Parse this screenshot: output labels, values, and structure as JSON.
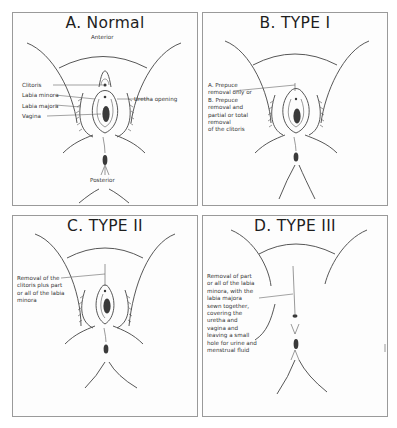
{
  "panels": [
    {
      "id": "A",
      "title": "A. Normal",
      "labels": {
        "anterior": "Anterior",
        "posterior": "Posterior",
        "clitoris": "Clitoris",
        "labia_minora": "Labia minora",
        "labia_majora": "Labia majora",
        "vagina": "Vagina",
        "urethra_opening": "Uretha opening"
      }
    },
    {
      "id": "B",
      "title": "B. TYPE I",
      "description": "A. Prepuce\nremoval only or\nB. Prepuce\nremoval and\npartial or total\nremoval\nof the clitoris"
    },
    {
      "id": "C",
      "title": "C. TYPE II",
      "description": "Removal of the\nclitoris plus part\nor all of the labia\nminora"
    },
    {
      "id": "D",
      "title": "D. TYPE III",
      "description": "Removal of part\nor all of the labia\nminora, with the\nlabia majora\nsewn together,\ncovering the\nuretha and\nvagina and\nleaving a small\nhole for urine and\nmenstrual fluid"
    }
  ],
  "colors": {
    "border": "#9a9a9a",
    "line": "#444444",
    "fill_dark": "#3a3a3a",
    "background": "#ffffff"
  }
}
